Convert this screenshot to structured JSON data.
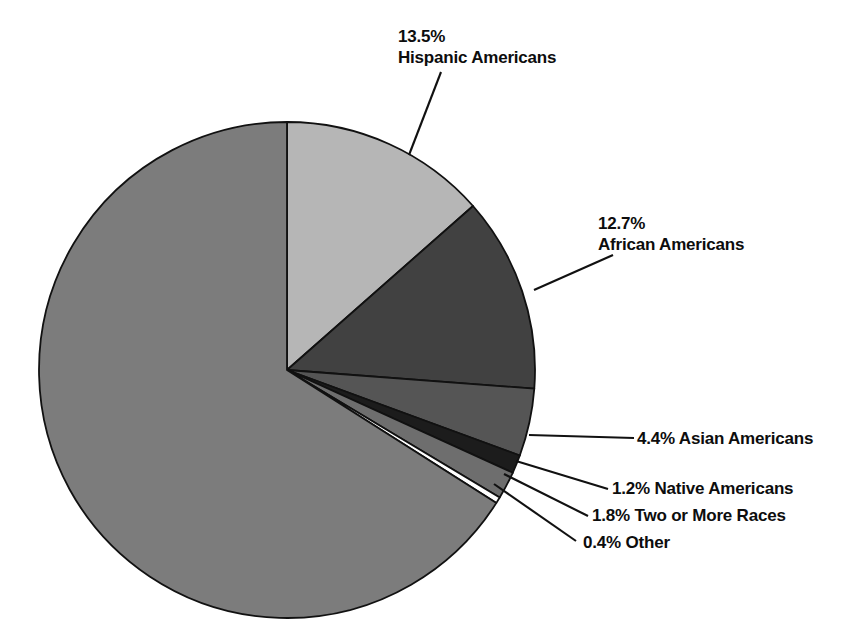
{
  "chart_data": {
    "type": "pie",
    "title": "",
    "subtitle": "",
    "xlabel": "",
    "ylabel": "",
    "legend_position": "callout-labels",
    "grid": false,
    "units": "percent",
    "start_angle_deg": 0,
    "direction": "clockwise",
    "center": {
      "x": 287,
      "y": 370
    },
    "radius": 248,
    "categories": [
      "Hispanic Americans",
      "African Americans",
      "Asian Americans",
      "Native Americans",
      "Two or More Races",
      "Other",
      ""
    ],
    "values": [
      13.5,
      12.7,
      4.4,
      1.2,
      1.8,
      0.4,
      66.0
    ],
    "colors": [
      "#b6b6b6",
      "#414141",
      "#555555",
      "#1c1c1c",
      "#6e6e6e",
      "#ffffff",
      "#7c7c7c"
    ],
    "slice_stroke": "#111111",
    "labeled": [
      true,
      true,
      true,
      true,
      true,
      true,
      false
    ],
    "slices": [
      {
        "label": "Hispanic Americans",
        "percent": 13.5,
        "percent_text": "13.5%",
        "color": "#b6b6b6"
      },
      {
        "label": "African Americans",
        "percent": 12.7,
        "percent_text": "12.7%",
        "color": "#414141"
      },
      {
        "label": "Asian Americans",
        "percent": 4.4,
        "percent_text": "4.4%",
        "color": "#555555"
      },
      {
        "label": "Native Americans",
        "percent": 1.2,
        "percent_text": "1.2%",
        "color": "#1c1c1c"
      },
      {
        "label": "Two or More Races",
        "percent": 1.8,
        "percent_text": "1.8%",
        "color": "#6e6e6e"
      },
      {
        "label": "Other",
        "percent": 0.4,
        "percent_text": "0.4%",
        "color": "#ffffff"
      },
      {
        "label": "",
        "percent": 66.0,
        "percent_text": "",
        "color": "#7c7c7c"
      }
    ]
  },
  "labels": {
    "hispanic": {
      "percent": "13.5%",
      "group": "Hispanic Americans"
    },
    "african": {
      "percent": "12.7%",
      "group": "African Americans"
    },
    "asian": {
      "percent": "4.4%",
      "group": "Asian Americans"
    },
    "native": {
      "percent": "1.2%",
      "group": "Native Americans"
    },
    "twomore": {
      "percent": "1.8%",
      "group": "Two or More Races"
    },
    "other": {
      "percent": "0.4%",
      "group": "Other"
    }
  },
  "colors": {
    "background": "#ffffff",
    "text": "#0d0d0d",
    "leader_line": "#111111"
  }
}
